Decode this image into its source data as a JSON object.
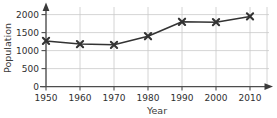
{
  "chart_data": {
    "type": "line",
    "title": "",
    "xlabel": "Year",
    "ylabel": "Population",
    "x": [
      1950,
      1960,
      1970,
      1980,
      1990,
      2000,
      2010
    ],
    "categories": [
      "1950",
      "1960",
      "1970",
      "1980",
      "1990",
      "2000",
      "2010"
    ],
    "values": [
      1270,
      1180,
      1160,
      1400,
      1800,
      1790,
      1950
    ],
    "series": [
      {
        "name": "Population",
        "values": [
          1270,
          1180,
          1160,
          1400,
          1800,
          1790,
          1950
        ]
      }
    ],
    "xlim": [
      1950,
      2010
    ],
    "ylim": [
      0,
      2100
    ],
    "ytick_labels": [
      "0",
      "500",
      "1000",
      "1500",
      "2000"
    ],
    "ytick_values": [
      0,
      500,
      1000,
      1500,
      2000
    ],
    "xtick_labels": [
      "1950",
      "1960",
      "1970",
      "1980",
      "1990",
      "2000",
      "2010"
    ],
    "xtick_values": [
      1950,
      1960,
      1970,
      1980,
      1990,
      2000,
      2010
    ],
    "grid": true,
    "legend": "none",
    "marker": "x-star",
    "line_color": "#333333",
    "grid_color": "#c9c9c9",
    "axis_color": "#4d4d4d",
    "text_color": "#2f2f2f",
    "background": "#ffffff"
  },
  "axes": {
    "y_label": "Population",
    "x_label": "Year"
  },
  "y_ticks": [
    {
      "label": "2000",
      "value": 2000
    },
    {
      "label": "1500",
      "value": 1500
    },
    {
      "label": "1000",
      "value": 1000
    },
    {
      "label": "500",
      "value": 500
    },
    {
      "label": "0",
      "value": 0
    }
  ],
  "x_ticks": [
    {
      "label": "1950",
      "value": 1950
    },
    {
      "label": "1960",
      "value": 1960
    },
    {
      "label": "1970",
      "value": 1970
    },
    {
      "label": "1980",
      "value": 1980
    },
    {
      "label": "1990",
      "value": 1990
    },
    {
      "label": "2000",
      "value": 2000
    },
    {
      "label": "2010",
      "value": 2010
    }
  ],
  "points": [
    {
      "x": 1950,
      "y": 1270
    },
    {
      "x": 1960,
      "y": 1180
    },
    {
      "x": 1970,
      "y": 1160
    },
    {
      "x": 1980,
      "y": 1400
    },
    {
      "x": 1990,
      "y": 1800
    },
    {
      "x": 2000,
      "y": 1790
    },
    {
      "x": 2010,
      "y": 1950
    }
  ]
}
